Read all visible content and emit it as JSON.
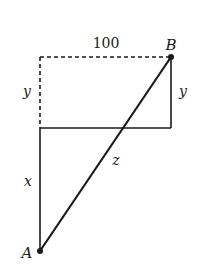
{
  "diagram": {
    "labels": {
      "top_length": "100",
      "point_b": "B",
      "point_a": "A",
      "left_y": "y",
      "right_y": "y",
      "x": "x",
      "z": "z"
    },
    "colors": {
      "line": "#1a1a1a",
      "background": "#ffffff"
    },
    "points": {
      "A": [
        40,
        251
      ],
      "B": [
        171,
        57
      ],
      "top_left": [
        40,
        57
      ],
      "mid_left": [
        40,
        128
      ],
      "mid_right": [
        171,
        128
      ]
    }
  }
}
